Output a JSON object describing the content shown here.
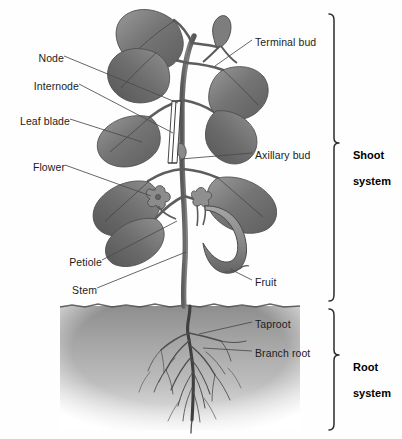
{
  "figure": {
    "background_color": "#fefefe",
    "leader_line_color": "#4a4a4a",
    "bracket_color": "#2b2b2b",
    "soil_color": "#8d8d8d",
    "plant_color": "#6f6f6f"
  },
  "labels": {
    "left": [
      {
        "id": "node",
        "text": "Node",
        "x": 60,
        "y": 59,
        "tip_x": 178,
        "tip_y": 103
      },
      {
        "id": "internode",
        "text": "Internode",
        "x": 75,
        "y": 87,
        "tip_x": 174,
        "tip_y": 134
      },
      {
        "id": "leaf-blade",
        "text": "Leaf blade",
        "x": 66,
        "y": 122,
        "tip_x": 141,
        "tip_y": 142
      },
      {
        "id": "flower",
        "text": "Flower",
        "x": 61,
        "y": 168,
        "tip_x": 152,
        "tip_y": 196
      },
      {
        "id": "petiole",
        "text": "Petiole",
        "x": 98,
        "y": 263,
        "tip_x": 176,
        "tip_y": 222
      },
      {
        "id": "stem",
        "text": "Stem",
        "x": 93,
        "y": 291,
        "tip_x": 186,
        "tip_y": 253
      }
    ],
    "right": [
      {
        "id": "terminal-bud",
        "text": "Terminal bud",
        "x": 255,
        "y": 43,
        "tip_x": 216,
        "tip_y": 66
      },
      {
        "id": "axillary-bud",
        "text": "Axillary bud",
        "x": 255,
        "y": 156,
        "tip_x": 179,
        "tip_y": 161
      },
      {
        "id": "fruit",
        "text": "Fruit",
        "x": 255,
        "y": 283,
        "tip_x": 229,
        "tip_y": 269
      },
      {
        "id": "taproot",
        "text": "Taproot",
        "x": 255,
        "y": 325,
        "tip_x": 199,
        "tip_y": 335
      },
      {
        "id": "branch-root",
        "text": "Branch root",
        "x": 255,
        "y": 354,
        "tip_x": 202,
        "tip_y": 349
      }
    ]
  },
  "brackets": [
    {
      "id": "shoot",
      "line1": "Shoot",
      "line2": "system",
      "top": 13,
      "bottom": 301,
      "x": 334,
      "label_x": 353,
      "label_y": 143
    },
    {
      "id": "root",
      "line1": "Root",
      "line2": "system",
      "top": 308,
      "bottom": 431,
      "x": 334,
      "label_x": 353,
      "label_y": 355
    }
  ]
}
